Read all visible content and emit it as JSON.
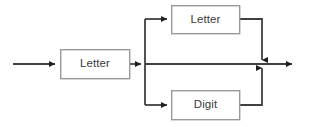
{
  "diagram": {
    "type": "railroad-syntax-diagram",
    "colors": {
      "background": "#ffffff",
      "line": "#404040",
      "box_border": "#9a9a9a",
      "box_fill": "#ffffff",
      "text": "#3a3a3a"
    },
    "nodes": [
      {
        "id": "letter-main",
        "label": "Letter",
        "x": 60,
        "y": 49,
        "width": 70,
        "height": 30
      },
      {
        "id": "letter-branch",
        "label": "Letter",
        "x": 171,
        "y": 5,
        "width": 69,
        "height": 29
      },
      {
        "id": "digit-branch",
        "label": "Digit",
        "x": 171,
        "y": 90,
        "width": 69,
        "height": 30
      }
    ],
    "edges": [
      {
        "id": "entry-arrow",
        "from": "start",
        "to": "letter-main"
      },
      {
        "id": "letter-main-to-fork",
        "from": "letter-main",
        "to": "fork"
      },
      {
        "id": "fork-to-letter-branch",
        "from": "fork",
        "to": "letter-branch"
      },
      {
        "id": "fork-to-digit-branch",
        "from": "fork",
        "to": "digit-branch"
      },
      {
        "id": "letter-branch-to-merge",
        "from": "letter-branch",
        "to": "merge"
      },
      {
        "id": "digit-branch-to-merge",
        "from": "digit-branch",
        "to": "merge"
      },
      {
        "id": "bypass-line",
        "from": "fork",
        "to": "merge"
      },
      {
        "id": "exit-arrow",
        "from": "merge",
        "to": "end"
      }
    ],
    "geometry": {
      "main_line_y": 64,
      "fork_x": 145,
      "merge_x": 262,
      "top_branch_y": 19,
      "bottom_branch_y": 105,
      "line_start_x": 13,
      "line_end_x": 298
    }
  }
}
